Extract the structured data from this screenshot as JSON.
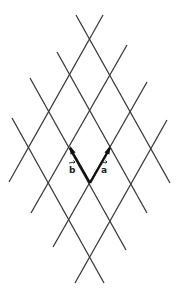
{
  "diagram": {
    "title": "",
    "colors": {
      "lines": "#3a3a3a",
      "vectors": "#111111",
      "background": "#ffffff"
    },
    "origin": [
      90,
      183
    ],
    "vectors": [
      {
        "name": "a",
        "label": "a",
        "from": [
          90,
          183
        ],
        "to": [
          110,
          148
        ]
      },
      {
        "name": "b",
        "label": "b",
        "from": [
          90,
          183
        ],
        "to": [
          70,
          148
        ]
      }
    ],
    "lines_direction_a": [
      {
        "from": [
          75,
          283
        ],
        "to": [
          167,
          120
        ]
      },
      {
        "from": [
          53,
          247
        ],
        "to": [
          147,
          82
        ]
      },
      {
        "from": [
          31,
          213
        ],
        "to": [
          127,
          45
        ]
      },
      {
        "from": [
          9,
          182
        ],
        "to": [
          103,
          15
        ]
      }
    ],
    "lines_direction_b": [
      {
        "from": [
          104,
          283
        ],
        "to": [
          12,
          118
        ]
      },
      {
        "from": [
          126,
          250
        ],
        "to": [
          30,
          78
        ]
      },
      {
        "from": [
          147,
          213
        ],
        "to": [
          57,
          52
        ]
      },
      {
        "from": [
          170,
          183
        ],
        "to": [
          76,
          15
        ]
      }
    ],
    "labels": {
      "a": "a",
      "b": "b"
    }
  }
}
